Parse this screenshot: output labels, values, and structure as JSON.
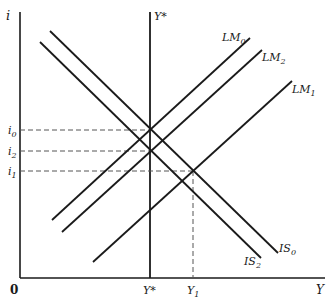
{
  "diagram": {
    "axes": {
      "y_label": "i",
      "x_label": "Y",
      "origin_label": "0"
    },
    "vertical_line": {
      "label_top": "Y*",
      "label_bottom": "Y*"
    },
    "y_ticks": [
      {
        "label": "i",
        "sub": "0"
      },
      {
        "label": "i",
        "sub": "2"
      },
      {
        "label": "i",
        "sub": "1"
      }
    ],
    "x_ticks": [
      {
        "label": "Y",
        "sub": "1"
      }
    ],
    "curves": {
      "LM0": {
        "label": "LM",
        "sub": "0"
      },
      "LM2": {
        "label": "LM",
        "sub": "2"
      },
      "LM1": {
        "label": "LM",
        "sub": "1"
      },
      "IS0": {
        "label": "IS",
        "sub": "0"
      },
      "IS2": {
        "label": "IS",
        "sub": "2"
      }
    },
    "colors": {
      "line": "#1a1a1a",
      "dashed": "#555555",
      "background": "#ffffff"
    }
  }
}
